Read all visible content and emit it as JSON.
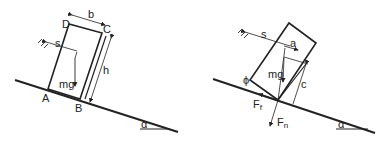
{
  "left_figure": {
    "labels": {
      "A": "A",
      "B": "B",
      "C": "C",
      "D": "D",
      "b": "b",
      "h": "h",
      "s": "s",
      "mg": "mg",
      "alpha": "α"
    }
  },
  "right_figure": {
    "labels": {
      "s": "s",
      "a": "a",
      "mg": "mg",
      "c": "c",
      "phi": "ϕ",
      "Ff": "F",
      "Ff_sub": "f",
      "Fn": "F",
      "Fn_sub": "n",
      "alpha": "α"
    }
  }
}
